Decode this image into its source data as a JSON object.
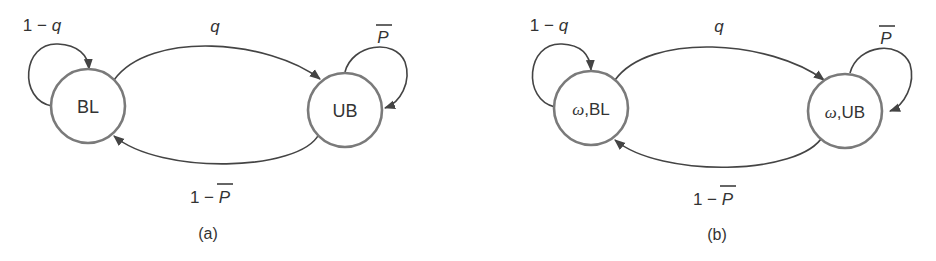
{
  "colors": {
    "background": "#ffffff",
    "state_stroke": "#7a7a7a",
    "edge_stroke": "#444444",
    "text": "#333333"
  },
  "panels": [
    {
      "caption": "(a)",
      "states": [
        {
          "id": "BL",
          "prefix": "",
          "label": "BL"
        },
        {
          "id": "UB",
          "prefix": "",
          "label": "UB"
        }
      ],
      "transitions": [
        {
          "from": "BL",
          "to": "BL",
          "label_num": "1 − ",
          "label_var": "q",
          "overline": false
        },
        {
          "from": "BL",
          "to": "UB",
          "label_num": "",
          "label_var": "q",
          "overline": false
        },
        {
          "from": "UB",
          "to": "UB",
          "label_num": "",
          "label_var": "P",
          "overline": true
        },
        {
          "from": "UB",
          "to": "BL",
          "label_num": "1 − ",
          "label_var": "P",
          "overline": true
        }
      ]
    },
    {
      "caption": "(b)",
      "states": [
        {
          "id": "wBL",
          "prefix": "ω",
          "label": ",BL"
        },
        {
          "id": "wUB",
          "prefix": "ω",
          "label": ",UB"
        }
      ],
      "transitions": [
        {
          "from": "wBL",
          "to": "wBL",
          "label_num": "1 − ",
          "label_var": "q",
          "overline": false
        },
        {
          "from": "wBL",
          "to": "wUB",
          "label_num": "",
          "label_var": "q",
          "overline": false
        },
        {
          "from": "wUB",
          "to": "wUB",
          "label_num": "",
          "label_var": "P",
          "overline": true
        },
        {
          "from": "wUB",
          "to": "wBL",
          "label_num": "1 − ",
          "label_var": "P",
          "overline": true
        }
      ]
    }
  ]
}
